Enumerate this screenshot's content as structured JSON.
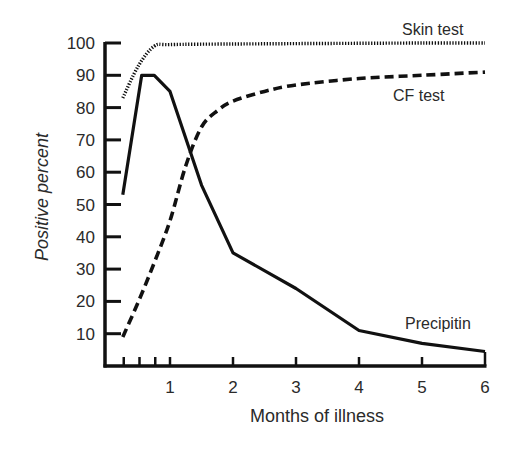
{
  "chart_data": {
    "type": "line",
    "title": "",
    "xlabel": "Months of illness",
    "ylabel": "Positive percent",
    "xlim": [
      0,
      6
    ],
    "ylim": [
      0,
      100
    ],
    "x_ticks": [
      1,
      2,
      3,
      4,
      5,
      6
    ],
    "x_minor_ticks": [
      0.25,
      0.5,
      0.75
    ],
    "y_ticks": [
      10,
      20,
      30,
      40,
      50,
      60,
      70,
      80,
      90,
      100
    ],
    "grid": false,
    "legend": "inline labels at line ends",
    "series": [
      {
        "name": "Skin test",
        "style": "dotted",
        "x": [
          0.25,
          0.5,
          0.75,
          1.0,
          2.0,
          3.0,
          4.0,
          5.0,
          6.0
        ],
        "values": [
          83,
          93,
          99,
          99.5,
          99.7,
          99.8,
          99.9,
          100,
          100
        ]
      },
      {
        "name": "CF test",
        "style": "dashed",
        "x": [
          0.25,
          0.5,
          0.75,
          1.0,
          1.25,
          1.5,
          1.75,
          2.0,
          2.5,
          3.0,
          4.0,
          5.0,
          6.0
        ],
        "values": [
          9,
          20,
          32,
          45,
          62,
          74,
          79,
          82,
          85,
          87,
          89,
          90,
          91
        ]
      },
      {
        "name": "Precipitin",
        "style": "solid",
        "x": [
          0.25,
          0.55,
          0.75,
          1.0,
          1.5,
          2.0,
          3.0,
          4.0,
          5.0,
          6.0
        ],
        "values": [
          53,
          90,
          90,
          85,
          56,
          35,
          24,
          11,
          7,
          4.5
        ]
      }
    ],
    "annotations": [
      {
        "text": "Skin test",
        "near_x": 5.3,
        "near_y": 104
      },
      {
        "text": "CF test",
        "near_x": 4.6,
        "near_y": 82
      },
      {
        "text": "Precipitin",
        "near_x": 5.0,
        "near_y": 12
      }
    ]
  },
  "axes": {
    "xlabel": "Months of illness",
    "ylabel": "Positive percent",
    "x_tick_labels": [
      "1",
      "2",
      "3",
      "4",
      "5",
      "6"
    ],
    "y_tick_labels": [
      "10",
      "20",
      "30",
      "40",
      "50",
      "60",
      "70",
      "80",
      "90",
      "100"
    ]
  },
  "labels": {
    "skin": "Skin test",
    "cf": "CF test",
    "precipitin": "Precipitin"
  },
  "colors": {
    "ink": "#111111",
    "text": "#2a2a2a",
    "background": "#ffffff"
  }
}
